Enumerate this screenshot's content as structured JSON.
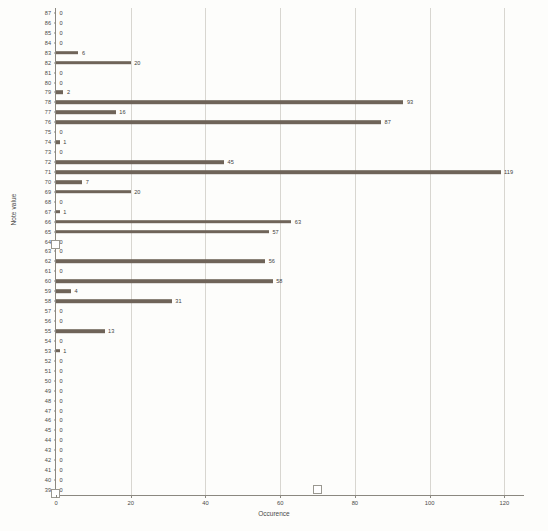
{
  "chart_data": {
    "type": "bar",
    "orientation": "horizontal",
    "title": "",
    "xlabel": "Occurence",
    "ylabel": "Note value",
    "xlim": [
      0,
      125
    ],
    "grid": "vertical",
    "legend": "none",
    "x_ticks": [
      0,
      20,
      40,
      60,
      80,
      100,
      120
    ],
    "categories": [
      87,
      86,
      85,
      84,
      83,
      82,
      81,
      80,
      79,
      78,
      77,
      76,
      75,
      74,
      73,
      72,
      71,
      70,
      69,
      68,
      67,
      66,
      65,
      64,
      63,
      62,
      61,
      60,
      59,
      58,
      57,
      56,
      55,
      54,
      53,
      52,
      51,
      50,
      49,
      48,
      47,
      46,
      45,
      44,
      43,
      42,
      41,
      40,
      39
    ],
    "values": [
      0,
      0,
      0,
      0,
      6,
      20,
      0,
      0,
      2,
      93,
      16,
      87,
      0,
      1,
      0,
      45,
      119,
      7,
      20,
      0,
      1,
      63,
      57,
      0,
      0,
      56,
      0,
      58,
      4,
      31,
      0,
      0,
      13,
      0,
      1,
      0,
      0,
      0,
      0,
      0,
      0,
      0,
      0,
      0,
      0,
      0,
      0,
      0,
      0
    ],
    "bar_color": "#6f6459",
    "grid_color": "#d8d6d0",
    "axis_color": "#8b8880"
  },
  "axes": {
    "x_title": "Occurence",
    "y_title": "Note value"
  }
}
